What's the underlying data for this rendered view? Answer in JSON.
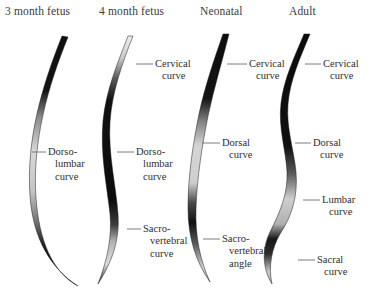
{
  "figure": {
    "title_row": [
      {
        "id": "fetus-3-month",
        "label": "3 month fetus",
        "x": 5,
        "y": 5
      },
      {
        "id": "fetus-4-month",
        "label": "4 month fetus",
        "x": 99,
        "y": 5
      },
      {
        "id": "neonatal",
        "label": "Neonatal",
        "x": 200,
        "y": 5
      },
      {
        "id": "adult",
        "label": "Adult",
        "x": 289,
        "y": 5
      }
    ],
    "panels": [
      {
        "id": "panel-3-month-fetus",
        "stage": "3 month fetus",
        "spine_shape": "single-c-curve",
        "callouts": [
          {
            "id": "dorso-lumbar-curve",
            "line1": "Dorso-",
            "line2": "lumbar",
            "line3": "curve",
            "x": 48,
            "y": 146,
            "leader_x1": 32,
            "leader_x2": 46,
            "leader_y": 152
          }
        ]
      },
      {
        "id": "panel-4-month-fetus",
        "stage": "4 month fetus",
        "spine_shape": "shallow-s-curve",
        "callouts": [
          {
            "id": "cervical-curve",
            "line1": "Cervical",
            "line2": "curve",
            "line3": "",
            "x": 155,
            "y": 58,
            "leader_x1": 136,
            "leader_x2": 153,
            "leader_y": 64
          },
          {
            "id": "dorso-lumbar-curve",
            "line1": "Dorso-",
            "line2": "lumbar",
            "line3": "curve",
            "x": 136,
            "y": 146,
            "leader_x1": 117,
            "leader_x2": 134,
            "leader_y": 152
          },
          {
            "id": "sacro-vertebral-curve",
            "line1": "Sacro-",
            "line2": "vertebral",
            "line3": "curve",
            "x": 143,
            "y": 223,
            "leader_x1": 127,
            "leader_x2": 141,
            "leader_y": 229
          }
        ]
      },
      {
        "id": "panel-neonatal",
        "stage": "Neonatal",
        "spine_shape": "s-curve-with-sacral-angle",
        "callouts": [
          {
            "id": "cervical-curve",
            "line1": "Cervical",
            "line2": "curve",
            "line3": "",
            "x": 249,
            "y": 58,
            "leader_x1": 227,
            "leader_x2": 247,
            "leader_y": 64
          },
          {
            "id": "dorsal-curve",
            "line1": "Dorsal",
            "line2": "curve",
            "line3": "",
            "x": 222,
            "y": 137,
            "leader_x1": 202,
            "leader_x2": 220,
            "leader_y": 143
          },
          {
            "id": "sacro-vertebral-angle",
            "line1": "Sacro-",
            "line2": "vertebral",
            "line3": "angle",
            "x": 222,
            "y": 233,
            "leader_x1": 203,
            "leader_x2": 220,
            "leader_y": 239
          }
        ]
      },
      {
        "id": "panel-adult",
        "stage": "Adult",
        "spine_shape": "full-s-curve",
        "callouts": [
          {
            "id": "cervical-curve",
            "line1": "Cervical",
            "line2": "curve",
            "line3": "",
            "x": 323,
            "y": 58,
            "leader_x1": 305,
            "leader_x2": 321,
            "leader_y": 64
          },
          {
            "id": "dorsal-curve",
            "line1": "Dorsal",
            "line2": "curve",
            "line3": "",
            "x": 313,
            "y": 137,
            "leader_x1": 295,
            "leader_x2": 311,
            "leader_y": 143
          },
          {
            "id": "lumbar-curve",
            "line1": "Lumbar",
            "line2": "curve",
            "line3": "",
            "x": 322,
            "y": 194,
            "leader_x1": 303,
            "leader_x2": 320,
            "leader_y": 200
          },
          {
            "id": "sacral-curve",
            "line1": "Sacral",
            "line2": "curve",
            "line3": "",
            "x": 317,
            "y": 254,
            "leader_x1": 298,
            "leader_x2": 315,
            "leader_y": 260
          }
        ]
      }
    ]
  }
}
